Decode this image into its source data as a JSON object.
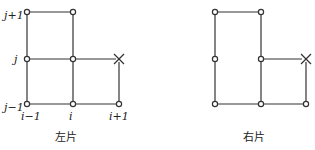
{
  "left": {
    "caption": "左片",
    "x_labels": [
      "i−1",
      "i",
      "i+1"
    ],
    "y_labels": [
      "j+1",
      "j",
      "j−1"
    ]
  },
  "right": {
    "caption": "右片"
  },
  "colors": {
    "line": "#333333",
    "node_fill": "#ffffff"
  }
}
